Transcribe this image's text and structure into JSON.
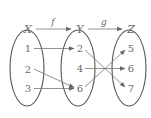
{
  "diagram": {
    "sets": [
      {
        "name": "X",
        "cx": 27,
        "cy": 68,
        "rx": 17,
        "ry": 38,
        "label_x": 28,
        "label_y": 33,
        "elements": [
          {
            "label": "1",
            "x": 28,
            "y": 52
          },
          {
            "label": "2",
            "x": 28,
            "y": 73
          },
          {
            "label": "3",
            "x": 28,
            "y": 92
          }
        ]
      },
      {
        "name": "Y",
        "cx": 78,
        "cy": 68,
        "rx": 17,
        "ry": 38,
        "label_x": 80,
        "label_y": 33,
        "elements": [
          {
            "label": "2",
            "x": 80,
            "y": 52
          },
          {
            "label": "4",
            "x": 80,
            "y": 72
          },
          {
            "label": "6",
            "x": 80,
            "y": 92
          }
        ]
      },
      {
        "name": "Z",
        "cx": 129,
        "cy": 68,
        "rx": 17,
        "ry": 38,
        "label_x": 131,
        "label_y": 33,
        "elements": [
          {
            "label": "5",
            "x": 131,
            "y": 52
          },
          {
            "label": "6",
            "x": 131,
            "y": 72
          },
          {
            "label": "7",
            "x": 131,
            "y": 92
          }
        ]
      }
    ],
    "functions": [
      {
        "name": "f",
        "from": "X",
        "to": "Y",
        "label_x": 53,
        "label_y": 25
      },
      {
        "name": "g",
        "from": "Y",
        "to": "Z",
        "label_x": 104,
        "label_y": 25
      }
    ],
    "mappings": {
      "f": [
        {
          "from": "1",
          "to": "2"
        },
        {
          "from": "2",
          "to": "6"
        },
        {
          "from": "3",
          "to": "6"
        }
      ],
      "g": [
        {
          "from": "2",
          "to": "7"
        },
        {
          "from": "4",
          "to": "6"
        },
        {
          "from": "6",
          "to": "5"
        }
      ]
    },
    "colors": {
      "stroke": "#555555",
      "text": "#6a6a6a",
      "arrow": "#777777"
    }
  }
}
